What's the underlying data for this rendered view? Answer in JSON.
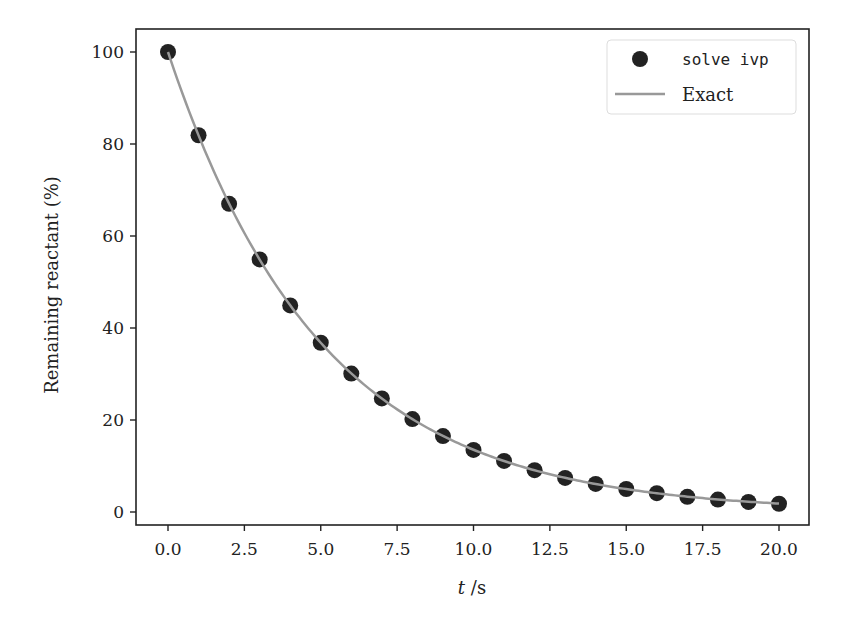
{
  "chart_data": {
    "type": "scatter+line",
    "title": "",
    "xlabel": "t /s",
    "xlabel_italic_part": "t",
    "xlabel_unit_part": " /s",
    "ylabel": "Remaining reactant (%)",
    "xlim": [
      -1.0,
      21.0
    ],
    "ylim": [
      -2.8,
      105
    ],
    "x_ticks": [
      0.0,
      2.5,
      5.0,
      7.5,
      10.0,
      12.5,
      15.0,
      17.5,
      20.0
    ],
    "x_tick_labels": [
      "0.0",
      "2.5",
      "5.0",
      "7.5",
      "10.0",
      "12.5",
      "15.0",
      "17.5",
      "20.0"
    ],
    "y_ticks": [
      0,
      20,
      40,
      60,
      80,
      100
    ],
    "y_tick_labels": [
      "0",
      "20",
      "40",
      "60",
      "80",
      "100"
    ],
    "grid": false,
    "legend_position": "upper right",
    "series": [
      {
        "name": "solve ivp",
        "kind": "scatter",
        "color": "#222222",
        "x": [
          0,
          1,
          2,
          3,
          4,
          5,
          6,
          7,
          8,
          9,
          10,
          11,
          12,
          13,
          14,
          15,
          16,
          17,
          18,
          19,
          20
        ],
        "y": [
          100.0,
          81.9,
          67.0,
          54.9,
          44.9,
          36.8,
          30.1,
          24.7,
          20.2,
          16.5,
          13.5,
          11.1,
          9.1,
          7.4,
          6.1,
          5.0,
          4.1,
          3.3,
          2.7,
          2.2,
          1.8
        ]
      },
      {
        "name": "Exact",
        "kind": "line",
        "color": "#999999",
        "formula": "100*exp(-0.2*t)",
        "x_range": [
          0,
          20
        ]
      }
    ]
  },
  "legend": {
    "items": [
      {
        "label": "solve ivp",
        "kind": "marker"
      },
      {
        "label": "Exact",
        "kind": "line"
      }
    ]
  }
}
